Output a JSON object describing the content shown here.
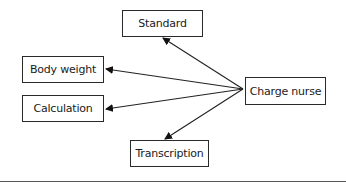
{
  "diagram": {
    "type": "hub-and-spoke",
    "nodes": [
      {
        "id": "standard",
        "label": "Standard"
      },
      {
        "id": "body_weight",
        "label": "Body weight"
      },
      {
        "id": "calculation",
        "label": "Calculation"
      },
      {
        "id": "charge_nurse",
        "label": "Charge nurse"
      },
      {
        "id": "transcription",
        "label": "Transcription"
      }
    ],
    "edges": [
      {
        "from": "charge_nurse",
        "to": "standard"
      },
      {
        "from": "charge_nurse",
        "to": "body_weight"
      },
      {
        "from": "charge_nurse",
        "to": "calculation"
      },
      {
        "from": "charge_nurse",
        "to": "transcription"
      }
    ]
  }
}
